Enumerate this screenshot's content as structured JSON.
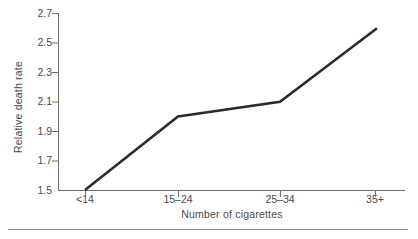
{
  "chart_data": {
    "type": "line",
    "title": "",
    "subtitle": "",
    "xlabel": "Number of cigarettes",
    "ylabel": "Relative death rate",
    "categories": [
      "<14",
      "15–24",
      "25–34",
      "35+"
    ],
    "values": [
      1.5,
      2.0,
      2.1,
      2.6
    ],
    "series": [
      {
        "name": "Relative death rate",
        "values": [
          1.5,
          2.0,
          2.1,
          2.6
        ]
      }
    ],
    "ylim": [
      1.5,
      2.7
    ],
    "ytick_labels": [
      "1.5",
      "1.7",
      "1.9",
      "2.1",
      "2.3",
      "2.5",
      "2.7"
    ],
    "ytick_values": [
      1.5,
      1.7,
      1.9,
      2.1,
      2.3,
      2.5,
      2.7
    ],
    "xtick_labels": [
      "<14",
      "15–24",
      "25–34",
      "35+"
    ],
    "grid": false,
    "legend": false,
    "legend_position": "none",
    "annotations": [],
    "line_color": "#2b2b2b",
    "axis_color": "#6f6f6f",
    "text_color": "#4a4a4a",
    "background_color": "#ffffff",
    "markers": false
  },
  "figure": {
    "footer_rule_color": "#8c8c8c"
  }
}
